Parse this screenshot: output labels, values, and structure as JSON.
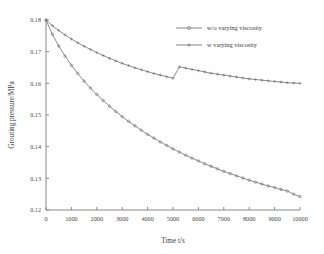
{
  "chart_data": {
    "type": "line",
    "title": "",
    "xlabel": "Time t/s",
    "ylabel": "Grouting pressure/MPa",
    "xlim": [
      0,
      10000
    ],
    "ylim": [
      0.12,
      0.18
    ],
    "xticks": [
      0,
      1000,
      2000,
      3000,
      4000,
      5000,
      6000,
      7000,
      8000,
      9000,
      10000
    ],
    "xticklabels": [
      "0",
      "1000",
      "2000",
      "3000",
      "4000",
      "5000",
      "6000",
      "7000",
      "8000",
      "9000",
      "10000"
    ],
    "yticks": [
      0.12,
      0.13,
      0.14,
      0.15,
      0.16,
      0.17,
      0.18
    ],
    "yticklabels": [
      "0.12",
      "0.13",
      "0.14",
      "0.15",
      "0.16",
      "0.17",
      "0.18"
    ],
    "grid": false,
    "legend_position": "upper right",
    "series": [
      {
        "name": "w/o varying viscosity",
        "marker": "circle",
        "color": "#777777",
        "x": [
          0,
          250,
          500,
          750,
          1000,
          1250,
          1500,
          1750,
          2000,
          2250,
          2500,
          2750,
          3000,
          3250,
          3500,
          3750,
          4000,
          4250,
          4500,
          4750,
          5000,
          5250,
          5500,
          5750,
          6000,
          6250,
          6500,
          6750,
          7000,
          7250,
          7500,
          7750,
          8000,
          8250,
          8500,
          8750,
          9000,
          9250,
          9500,
          9750,
          10000
        ],
        "values": [
          0.18,
          0.1755,
          0.1718,
          0.1686,
          0.1657,
          0.1631,
          0.1607,
          0.1585,
          0.1565,
          0.1546,
          0.1528,
          0.1511,
          0.1495,
          0.148,
          0.1466,
          0.1452,
          0.1439,
          0.1427,
          0.1415,
          0.1404,
          0.1393,
          0.1383,
          0.1373,
          0.1364,
          0.1355,
          0.1346,
          0.1338,
          0.133,
          0.1322,
          0.1315,
          0.1308,
          0.1301,
          0.1294,
          0.1288,
          0.1282,
          0.1276,
          0.1271,
          0.1265,
          0.126,
          0.125,
          0.1242
        ]
      },
      {
        "name": "w varying viscosity",
        "marker": "plus",
        "color": "#777777",
        "x": [
          0,
          250,
          500,
          750,
          1000,
          1250,
          1500,
          1750,
          2000,
          2250,
          2500,
          2750,
          3000,
          3250,
          3500,
          3750,
          4000,
          4250,
          4500,
          4750,
          5000,
          5250,
          5500,
          5750,
          6000,
          6250,
          6500,
          6750,
          7000,
          7250,
          7500,
          7750,
          8000,
          8250,
          8500,
          8750,
          9000,
          9250,
          9500,
          9750,
          10000
        ],
        "values": [
          0.18,
          0.1782,
          0.1767,
          0.1753,
          0.174,
          0.1728,
          0.1717,
          0.1707,
          0.1697,
          0.1688,
          0.1679,
          0.1671,
          0.1663,
          0.1656,
          0.1649,
          0.1643,
          0.1637,
          0.1631,
          0.1626,
          0.1621,
          0.1616,
          0.1652,
          0.1648,
          0.1644,
          0.164,
          0.1636,
          0.1632,
          0.1629,
          0.1626,
          0.1623,
          0.162,
          0.1617,
          0.1614,
          0.1612,
          0.161,
          0.1608,
          0.1606,
          0.1604,
          0.1602,
          0.1601,
          0.16
        ]
      }
    ]
  }
}
